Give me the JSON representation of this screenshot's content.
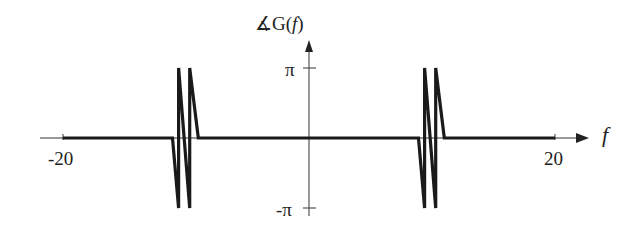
{
  "chart_data": {
    "type": "line",
    "title": "",
    "ylabel": "∡G(f)",
    "xlabel": "f",
    "x_tick_labels": [
      "-20",
      "20"
    ],
    "y_tick_labels": [
      "π",
      "-π"
    ],
    "xlim": [
      -20,
      20
    ],
    "ylim": [
      -3.14159,
      3.14159
    ],
    "grid": false,
    "legend": null,
    "series": [
      {
        "name": "phase of G(f)",
        "description": "Phase is zero everywhere except two bursts near f≈-10.8 and f≈9.5 where it oscillates sawtooth-like between -π and π",
        "x": [
          -20,
          -11.1,
          -10.6,
          -10.6,
          -9.7,
          -9.7,
          -9.0,
          -9.0,
          8.9,
          9.4,
          9.4,
          10.3,
          10.3,
          11.0,
          11.0,
          20
        ],
        "y": [
          0,
          0,
          -3.14159,
          3.14159,
          -3.14159,
          3.14159,
          0,
          0,
          0,
          -3.14159,
          3.14159,
          -3.14159,
          3.14159,
          0,
          0,
          0
        ]
      }
    ]
  },
  "labels": {
    "y_axis_title": "∡G(",
    "y_axis_var": "f",
    "y_axis_close": ")",
    "x_axis_var": "f",
    "x_min": "-20",
    "x_max": "20",
    "y_pi": "π",
    "y_neg_pi": "-π"
  }
}
